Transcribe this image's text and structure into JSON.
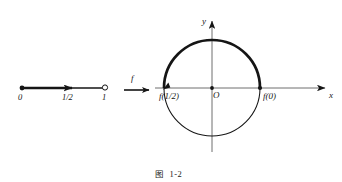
{
  "figure": {
    "caption_prefix": "图",
    "caption_number": "1-2",
    "background_color": "#ffffff",
    "ink_color": "#151515"
  },
  "domain_line": {
    "name": "unit-interval",
    "description": "half-open interval [0,1) on a number line with arrow of direction",
    "start_label": "0",
    "mid_label": "1/2",
    "end_label": "1",
    "start_endpoint": "closed",
    "end_endpoint": "open",
    "axis_y": 88,
    "x_start": 22,
    "x_end": 105,
    "arrow_x": 74
  },
  "mapping": {
    "name": "f",
    "label": "f",
    "arrow_from_x": 124,
    "arrow_to_x": 150,
    "arrow_y": 90,
    "label_x": 131,
    "label_y": 74
  },
  "plane": {
    "x_axis_label": "x",
    "y_axis_label": "y",
    "origin_label": "O",
    "center_x": 212,
    "center_y": 88,
    "radius": 48,
    "x_axis_from": 155,
    "x_axis_to": 327,
    "y_axis_from": 152,
    "y_axis_to": 19
  },
  "circle": {
    "description": "unit circle image of f; bold upper arc traced from f(0) counter-clockwise to f(1/2)",
    "bold_arc_stroke": 2.6,
    "thin_arc_stroke": 1.0,
    "points": [
      {
        "id": "f-zero",
        "label": "f(0)",
        "angle_deg": 0,
        "marker": "dot",
        "label_x": 264,
        "label_y": 93
      },
      {
        "id": "f-half",
        "label": "f(1/2)",
        "angle_deg": 180,
        "marker": "arrowhead",
        "label_x": 160,
        "label_y": 93
      }
    ]
  }
}
